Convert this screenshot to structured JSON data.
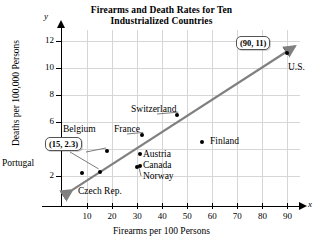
{
  "chart_data": {
    "type": "scatter",
    "title": "Firearms and Death Rates for Ten Industrialized Countries",
    "title_line1": "Firearms and Death Rates for Ten",
    "title_line2": "Industrialized Countries",
    "xlabel": "Firearms per 100 Persons",
    "ylabel": "Deaths per 100,000 Persons",
    "x_axis_letter": "x",
    "y_axis_letter": "y",
    "xlim": [
      0,
      95
    ],
    "ylim": [
      0,
      12.8
    ],
    "xticks": [
      10,
      20,
      30,
      40,
      50,
      60,
      70,
      80,
      90
    ],
    "yticks": [
      2,
      4,
      6,
      8,
      10,
      12
    ],
    "grid": true,
    "legend": "none",
    "point_color": "#000000",
    "trendline_color": "#808080",
    "gridline_color": "#d6d6d6",
    "points": [
      {
        "label": "Portugal",
        "x": 8,
        "y": 2.2
      },
      {
        "label": "Czech Rep.",
        "x": 15,
        "y": 2.3
      },
      {
        "label": "Belgium",
        "x": 18,
        "y": 3.85
      },
      {
        "label": "Norway",
        "x": 30,
        "y": 2.65
      },
      {
        "label": "Canada",
        "x": 31,
        "y": 2.75
      },
      {
        "label": "Austria",
        "x": 31,
        "y": 3.6
      },
      {
        "label": "France",
        "x": 32,
        "y": 5.0
      },
      {
        "label": "Switzerland",
        "x": 46,
        "y": 6.5
      },
      {
        "label": "Finland",
        "x": 56,
        "y": 4.5
      },
      {
        "label": "U.S.",
        "x": 90,
        "y": 11.1
      }
    ],
    "annotations": [
      {
        "name": "us-callout",
        "text": "(90, 11)",
        "points_to": "U.S."
      },
      {
        "name": "czech-callout",
        "text": "(15, 2.3)",
        "points_to": "Czech Rep."
      }
    ],
    "trendline": {
      "description": "rising straight line with arrowheads at both ends"
    }
  },
  "labels": {
    "portugal": "Portugal",
    "czech": "Czech Rep.",
    "belgium": "Belgium",
    "norway": "Norway",
    "canada": "Canada",
    "austria": "Austria",
    "france": "France",
    "switzerland": "Switzerland",
    "finland": "Finland",
    "us": "U.S."
  },
  "ticks": {
    "y": [
      "12",
      "10",
      "8",
      "6",
      "4",
      "2"
    ],
    "x": [
      "10",
      "20",
      "30",
      "40",
      "50",
      "60",
      "70",
      "80",
      "90"
    ]
  }
}
